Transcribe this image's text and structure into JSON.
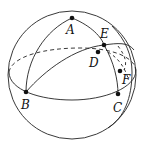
{
  "figure": {
    "type": "spherical-geometry-diagram",
    "stroke_color": "#222222",
    "points": [
      {
        "id": "A",
        "label": "A",
        "x": 72,
        "y": 18,
        "lx": 66,
        "ly": 34
      },
      {
        "id": "B",
        "label": "B",
        "x": 26,
        "y": 92,
        "lx": 21,
        "ly": 109
      },
      {
        "id": "C",
        "label": "C",
        "x": 118,
        "y": 94,
        "lx": 113,
        "ly": 112
      },
      {
        "id": "D",
        "label": "D",
        "x": 98,
        "y": 52,
        "lx": 89,
        "ly": 67
      },
      {
        "id": "E",
        "label": "E",
        "x": 104,
        "y": 45,
        "lx": 100,
        "ly": 38
      },
      {
        "id": "F",
        "label": "F",
        "x": 120,
        "y": 71,
        "lx": 122,
        "ly": 84
      }
    ]
  }
}
